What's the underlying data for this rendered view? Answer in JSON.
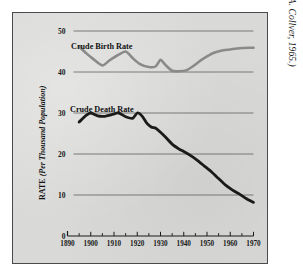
{
  "figure": {
    "attribution": "(From O. A. Collver, 1965.)",
    "background_color": "#d9d9d7",
    "frame_color": "#4a4a4a"
  },
  "axis": {
    "y_label_main": "RATE",
    "y_label_paren": "(Per Thousand Population)",
    "y_ticks": [
      "0",
      "10",
      "20",
      "30",
      "40",
      "50"
    ],
    "x_ticks": [
      "1890",
      "1900",
      "1910",
      "1920",
      "1930",
      "1940",
      "1950",
      "1960",
      "1970"
    ]
  },
  "labels": {
    "birth_rate": "Crude Birth Rate",
    "death_rate": "Crude Death Rate"
  },
  "chart_data": {
    "type": "line",
    "title": "",
    "subtitle": "",
    "xlabel": "",
    "ylabel": "RATE (Per Thousand Population)",
    "xlim": [
      1890,
      1970
    ],
    "ylim": [
      0,
      50
    ],
    "grid": true,
    "legend": "inline-annotations",
    "annotations": [
      {
        "text": "Crude Birth Rate",
        "x": 1905,
        "y": 47.5
      },
      {
        "text": "Crude Death Rate",
        "x": 1903,
        "y": 31.8
      },
      {
        "text": "(From O. A. Collver, 1965.)",
        "x": 1975,
        "y": 45
      }
    ],
    "y_ticks": [
      0,
      10,
      20,
      30,
      40,
      50
    ],
    "x_ticks_major": [
      1890,
      1900,
      1910,
      1920,
      1930,
      1940,
      1950,
      1960,
      1970
    ],
    "x_ticks_minor": [
      1895,
      1905,
      1915,
      1925,
      1935,
      1945,
      1955,
      1965
    ],
    "series": [
      {
        "name": "Crude Birth Rate",
        "color": "#8a8a8a",
        "linewidth": 2.6,
        "x": [
          1895,
          1898,
          1901,
          1905,
          1908,
          1911,
          1915,
          1918,
          1921,
          1925,
          1928,
          1930,
          1932,
          1935,
          1938,
          1941,
          1944,
          1947,
          1950,
          1953,
          1957,
          1960,
          1964,
          1968,
          1970
        ],
        "values": [
          46.2,
          44.6,
          43.2,
          41.6,
          42.8,
          43.9,
          45.0,
          43.4,
          42.0,
          41.2,
          41.4,
          43.0,
          41.8,
          40.3,
          40.2,
          40.4,
          41.4,
          42.7,
          43.8,
          44.7,
          45.3,
          45.5,
          45.8,
          45.9,
          45.9
        ]
      },
      {
        "name": "Crude Death Rate",
        "color": "#1a1a1a",
        "linewidth": 2.8,
        "x": [
          1895,
          1898,
          1900,
          1903,
          1906,
          1909,
          1912,
          1915,
          1918,
          1920,
          1922,
          1924,
          1926,
          1928,
          1930,
          1932,
          1935,
          1938,
          1940,
          1943,
          1946,
          1949,
          1952,
          1955,
          1958,
          1961,
          1964,
          1967,
          1970
        ],
        "values": [
          27.8,
          29.4,
          30.0,
          29.3,
          29.2,
          29.6,
          30.0,
          29.1,
          28.7,
          30.0,
          29.3,
          27.6,
          26.6,
          26.3,
          25.3,
          24.2,
          22.4,
          21.2,
          20.6,
          19.6,
          18.4,
          17.0,
          15.6,
          14.0,
          12.4,
          11.2,
          10.2,
          9.1,
          8.2
        ]
      }
    ]
  }
}
